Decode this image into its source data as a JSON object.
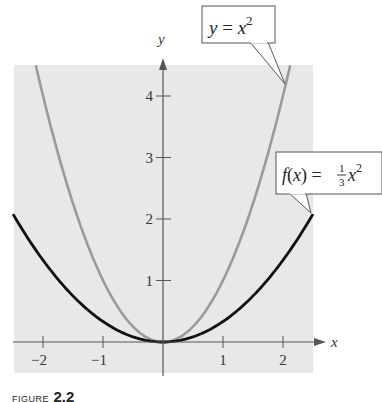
{
  "figure": {
    "caption_word": "FIGURE",
    "caption_number": "2.2"
  },
  "chart_data": {
    "type": "line",
    "title": "",
    "xlabel": "x",
    "ylabel": "y",
    "xlim": [
      -2.5,
      2.5
    ],
    "ylim": [
      -0.5,
      4.5
    ],
    "x_ticks": [
      -2,
      -1,
      1,
      2
    ],
    "x_tick_labels": [
      "−2",
      "−1",
      "1",
      "2"
    ],
    "y_ticks": [
      1,
      2,
      3,
      4
    ],
    "y_tick_labels": [
      "1",
      "2",
      "3",
      "4"
    ],
    "grid": false,
    "background": "#e8e8e8",
    "series": [
      {
        "name": "y = x^2",
        "label_main": "y = x",
        "label_exp": "2",
        "color": "#9a9a9a",
        "x": [
          -2.12,
          -2,
          -1.5,
          -1,
          -0.5,
          0,
          0.5,
          1,
          1.5,
          2,
          2.12
        ],
        "y": [
          4.5,
          4,
          2.25,
          1,
          0.25,
          0,
          0.25,
          1,
          2.25,
          4,
          4.5
        ]
      },
      {
        "name": "f(x) = (1/3)x^2",
        "label_main": "f(x) = ",
        "label_num": "1",
        "label_den": "3",
        "label_var": "x",
        "label_exp": "2",
        "color": "#111111",
        "x": [
          -2.5,
          -2,
          -1.5,
          -1,
          -0.5,
          0,
          0.5,
          1,
          1.5,
          2,
          2.5
        ],
        "y": [
          2.08,
          1.33,
          0.75,
          0.33,
          0.08,
          0,
          0.08,
          0.33,
          0.75,
          1.33,
          2.08
        ]
      }
    ]
  }
}
